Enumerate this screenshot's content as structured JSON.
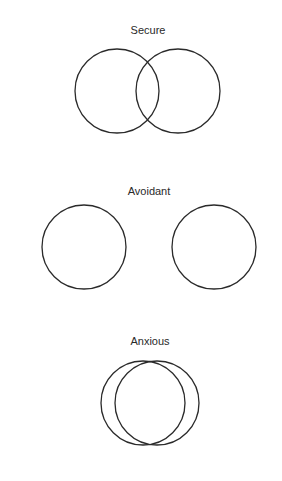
{
  "diagrams": [
    {
      "title": "Secure",
      "label_x": 148,
      "label_y": 24,
      "circles": [
        {
          "cx": 117,
          "cy": 91,
          "r": 42
        },
        {
          "cx": 178,
          "cy": 91,
          "r": 42
        }
      ]
    },
    {
      "title": "Avoidant",
      "label_x": 149,
      "label_y": 185,
      "circles": [
        {
          "cx": 84,
          "cy": 247,
          "r": 42
        },
        {
          "cx": 214,
          "cy": 247,
          "r": 42
        }
      ]
    },
    {
      "title": "Anxious",
      "label_x": 150,
      "label_y": 335,
      "circles": [
        {
          "cx": 143,
          "cy": 403,
          "r": 42
        },
        {
          "cx": 157,
          "cy": 403,
          "r": 42
        }
      ]
    }
  ],
  "style": {
    "stroke": "#2a2a2a",
    "stroke_width": 1.3
  }
}
